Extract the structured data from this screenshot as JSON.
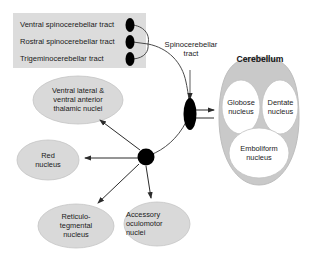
{
  "figure": {
    "background_color": "#ffffff",
    "shape_fill": "#d8d8d8",
    "shape_stroke": "#b4b4b4",
    "node_color": "#000000",
    "line_color": "#333333"
  },
  "input_box": {
    "name": "spinocerebellar-input-box",
    "fill": "#dcdcdc",
    "tracts": [
      {
        "label": "Ventral spinocerebellar tract"
      },
      {
        "label": "Rostral spinocerebellar tract"
      },
      {
        "label": "Trigeminocerebellar tract"
      }
    ]
  },
  "annotations": {
    "spinocerebellar_tract": "Spinocerebellar\ntract",
    "spinocerebellar_tract_line1": "Spinocerebellar",
    "spinocerebellar_tract_line2": "tract"
  },
  "cerebellum": {
    "title": "Cerebellum",
    "nuclei": [
      {
        "name": "globose-nucleus",
        "line1": "Globose",
        "line2": "nucleus"
      },
      {
        "name": "dentate-nucleus",
        "line1": "Dentate",
        "line2": "nucleus"
      },
      {
        "name": "emboliform-nucleus",
        "line1": "Emboliform",
        "line2": "nucleus"
      }
    ]
  },
  "targets": [
    {
      "name": "thalamic-nuclei",
      "line1": "Ventral lateral &",
      "line2": "ventral anterior",
      "line3": "thalamic nuclei"
    },
    {
      "name": "red-nucleus",
      "line1": "Red",
      "line2": "nucleus"
    },
    {
      "name": "reticulotegmental-nucleus",
      "line1": "Reticulo-",
      "line2": "tegmental",
      "line3": "nucleus"
    },
    {
      "name": "accessory-oculomotor-nuclei",
      "line1": "Accessory",
      "line2": "oculomotor",
      "line3": "nuclei"
    }
  ],
  "hub": {
    "name": "cerebellar-output-hub"
  }
}
